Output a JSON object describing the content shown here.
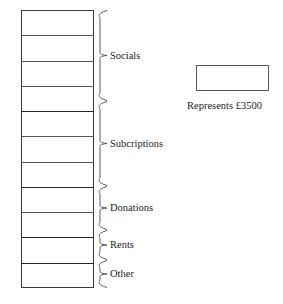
{
  "chart_data": {
    "type": "bar",
    "orientation": "vertical-stacked",
    "title": "",
    "xlabel": "",
    "ylabel": "",
    "unit_value": 3500,
    "currency_symbol": "£",
    "grid": false,
    "legend_position": "right",
    "segment_count_total": 11,
    "categories": [
      "Socials",
      "Subcriptions",
      "Donations",
      "Rents",
      "Other"
    ],
    "values": [
      4,
      3,
      2,
      1,
      1
    ],
    "amounts": [
      14000,
      10500,
      7000,
      3500,
      3500
    ],
    "annotations": [
      "Represents £3500"
    ]
  },
  "bar": {
    "segments": [
      {
        "label": "Socials",
        "units": 4,
        "divider_weight": "minor"
      },
      {
        "label": "Subcriptions",
        "units": 3,
        "divider_weight": "minor"
      },
      {
        "label": "Donations",
        "units": 2,
        "divider_weight": "minor"
      },
      {
        "label": "Rents",
        "units": 1,
        "divider_weight": "minor"
      },
      {
        "label": "Other",
        "units": 1,
        "divider_weight": "minor"
      }
    ]
  },
  "groups": [
    {
      "label": "Socials",
      "brace_top": 2,
      "brace_bottom": 93
    },
    {
      "label": "Subcriptions",
      "brace_top": 93,
      "brace_bottom": 178
    },
    {
      "label": "Donations",
      "brace_top": 178,
      "brace_bottom": 222
    },
    {
      "label": "Rents",
      "brace_top": 222,
      "brace_bottom": 252
    },
    {
      "label": "Other",
      "brace_top": 252,
      "brace_bottom": 280
    }
  ],
  "legend": {
    "caption": "Represents £3500",
    "swatch_name": "unit-rectangle"
  }
}
